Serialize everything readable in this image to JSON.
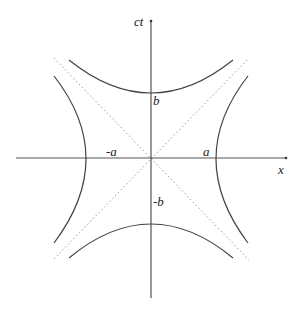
{
  "diagram": {
    "type": "hyperbola-conjugate-pair",
    "axes": {
      "horizontal_label": "x",
      "vertical_label": "ct"
    },
    "labels": {
      "a_pos": "a",
      "a_neg": "-a",
      "b_pos": "b",
      "b_neg": "-b"
    },
    "colors": {
      "curve": "#444444",
      "axis": "#555555",
      "asymptote": "#999999",
      "background": "#ffffff"
    },
    "geometry": {
      "origin": [
        151,
        158
      ],
      "a_px": 49,
      "b_px": 50,
      "asymptote_style": "dotted"
    }
  }
}
